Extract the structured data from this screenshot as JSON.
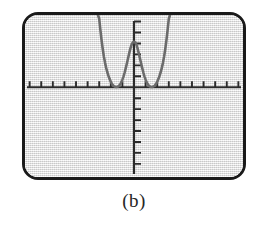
{
  "figure": {
    "caption": "(b)",
    "device": "graphing-calculator-screen"
  },
  "colors": {
    "bezel": "#1a1a1a",
    "screen_background": "#e8e8e8",
    "axis": "#2b2b2b",
    "curve": "#6b6b6b",
    "caption_text": "#262626"
  },
  "chart_data": {
    "type": "line",
    "title": "",
    "subtitle": "",
    "xlabel": "",
    "ylabel": "",
    "xlim": [
      -9.4,
      9.4
    ],
    "ylim": [
      -8.2,
      6.6
    ],
    "grid": false,
    "legend": null,
    "axis_ticks": {
      "x_tick_interval": 1,
      "x_tick_values": [
        -9,
        -8,
        -7,
        -6,
        -5,
        -4,
        -3,
        -2,
        -1,
        1,
        2,
        3,
        4,
        5,
        6,
        7,
        8,
        9
      ],
      "y_tick_interval": 1,
      "y_tick_values": [
        -8,
        -7,
        -6,
        -5,
        -4,
        -3,
        -2,
        -1,
        1,
        2,
        3,
        4,
        5,
        6
      ],
      "tick_labels_shown": false
    },
    "annotations": [
      {
        "kind": "double-root",
        "x": -2,
        "y": 0
      },
      {
        "kind": "double-root",
        "x": 2,
        "y": 0
      },
      {
        "kind": "local-maximum",
        "x": 0,
        "y": 4
      }
    ],
    "series": [
      {
        "name": "curve",
        "expression": "(x^2 - 4)^2 scaled",
        "x": [
          -3.1,
          -3.0,
          -2.9,
          -2.8,
          -2.7,
          -2.6,
          -2.5,
          -2.4,
          -2.3,
          -2.2,
          -2.1,
          -2.0,
          -1.9,
          -1.8,
          -1.7,
          -1.6,
          -1.5,
          -1.4,
          -1.3,
          -1.2,
          -1.1,
          -1.0,
          -0.9,
          -0.8,
          -0.7,
          -0.6,
          -0.5,
          -0.4,
          -0.3,
          -0.2,
          -0.1,
          0.0,
          0.1,
          0.2,
          0.3,
          0.4,
          0.5,
          0.6,
          0.7,
          0.8,
          0.9,
          1.0,
          1.1,
          1.2,
          1.3,
          1.4,
          1.5,
          1.6,
          1.7,
          1.8,
          1.9,
          2.0,
          2.1,
          2.2,
          2.3,
          2.4,
          2.5,
          2.6,
          2.7,
          2.8,
          2.9,
          3.0,
          3.1
        ],
        "y": [
          6.6,
          6.25,
          5.24,
          4.33,
          3.52,
          2.82,
          2.25,
          1.77,
          1.37,
          1.03,
          0.74,
          0.5,
          0.3,
          0.17,
          0.08,
          0.03,
          0.02,
          0.05,
          0.12,
          0.25,
          0.44,
          0.69,
          1.0,
          1.37,
          1.79,
          2.24,
          2.7,
          3.16,
          3.58,
          3.91,
          4.1,
          4.16,
          4.1,
          3.91,
          3.58,
          3.16,
          2.7,
          2.24,
          1.79,
          1.37,
          1.0,
          0.69,
          0.44,
          0.25,
          0.12,
          0.05,
          0.02,
          0.03,
          0.08,
          0.17,
          0.3,
          0.5,
          0.74,
          1.03,
          1.37,
          1.77,
          2.25,
          2.82,
          3.52,
          4.33,
          5.24,
          6.25,
          6.6
        ]
      }
    ]
  }
}
